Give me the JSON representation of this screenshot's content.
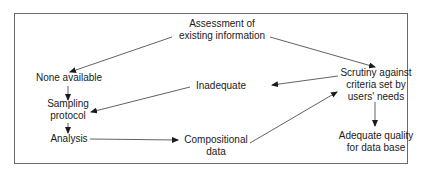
{
  "diagram": {
    "type": "flowchart",
    "nodes": {
      "assessment": {
        "line1": "Assessment of",
        "line2": "existing information"
      },
      "none_available": {
        "line1": "None available"
      },
      "inadequate": {
        "line1": "Inadequate"
      },
      "scrutiny": {
        "line1": "Scrutiny against",
        "line2": "criteria set by",
        "line3": "users' needs"
      },
      "sampling": {
        "line1": "Sampling",
        "line2": "protocol"
      },
      "analysis": {
        "line1": "Analysis"
      },
      "compositional": {
        "line1": "Compositional",
        "line2": "data"
      },
      "adequate": {
        "line1": "Adequate quality",
        "line2": "for data base"
      }
    },
    "edges": [
      {
        "from": "assessment",
        "to": "none_available"
      },
      {
        "from": "assessment",
        "to": "scrutiny"
      },
      {
        "from": "none_available",
        "to": "sampling"
      },
      {
        "from": "scrutiny",
        "to": "inadequate"
      },
      {
        "from": "inadequate",
        "to": "sampling"
      },
      {
        "from": "sampling",
        "to": "analysis"
      },
      {
        "from": "analysis",
        "to": "compositional"
      },
      {
        "from": "compositional",
        "to": "scrutiny"
      },
      {
        "from": "scrutiny",
        "to": "adequate"
      }
    ]
  }
}
